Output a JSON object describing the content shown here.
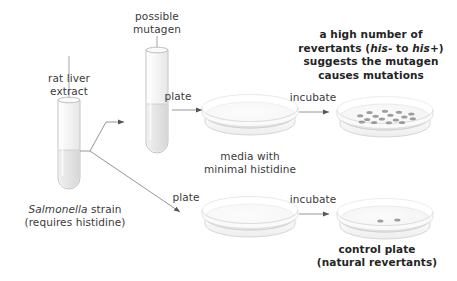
{
  "diagram": {
    "colors": {
      "text": "#3b3b3b",
      "text_bold": "#242424",
      "line": "#7a7a7a",
      "glass": "#c9c9c9",
      "glass_fill": "#f4f4f4",
      "media": "#e8e8e8",
      "colony": "#8d8d8d",
      "background": "#ffffff"
    },
    "labels": {
      "rat_liver_extract": "rat liver\nextract",
      "possible_mutagen": "possible\nmutagen",
      "salmonella_strain_line1_italic": "Salmonella",
      "salmonella_strain_line1_rest": " strain",
      "salmonella_strain_line2": "(requires histidine)",
      "plate_top": "plate",
      "plate_bottom": "plate",
      "incubate_top": "incubate",
      "incubate_bottom": "incubate",
      "media_with_minimal_histidine": "media with\nminimal histidine",
      "conclusion_line1": "a high number of",
      "conclusion_line2_a": "revertants (",
      "conclusion_line2_his_minus": "his",
      "conclusion_line2_b": "- to ",
      "conclusion_line2_his_plus": "his",
      "conclusion_line2_c": "+)",
      "conclusion_line3": "suggests the mutagen",
      "conclusion_line4": "causes mutations",
      "control_plate_line1": "control plate",
      "control_plate_line2": "(natural revertants)"
    },
    "tubes": [
      {
        "id": "rat-liver-extract-tube",
        "label_key": "rat_liver_extract",
        "contents": "rat liver extract",
        "has_down_arrow": true
      },
      {
        "id": "possible-mutagen-tube",
        "label_key": "possible_mutagen",
        "contents": "possible mutagen",
        "has_down_arrow": true
      }
    ],
    "plates": [
      {
        "id": "top-plate-before-incubation",
        "row": "top",
        "stage": "before-incubation",
        "colony_count": 0,
        "media": "minimal histidine"
      },
      {
        "id": "top-plate-after-incubation",
        "row": "top",
        "stage": "after-incubation",
        "colony_count": 16,
        "media": "minimal histidine"
      },
      {
        "id": "control-plate-before-incubation",
        "row": "bottom",
        "stage": "before-incubation",
        "colony_count": 0,
        "media": "minimal histidine"
      },
      {
        "id": "control-plate-after-incubation",
        "row": "bottom",
        "stage": "after-incubation",
        "colony_count": 2,
        "media": "minimal histidine"
      }
    ],
    "colony_positions_mutagen": [
      [
        0.3,
        0.28
      ],
      [
        0.5,
        0.22
      ],
      [
        0.68,
        0.27
      ],
      [
        0.84,
        0.36
      ],
      [
        0.18,
        0.44
      ],
      [
        0.38,
        0.46
      ],
      [
        0.57,
        0.42
      ],
      [
        0.75,
        0.5
      ],
      [
        0.27,
        0.62
      ],
      [
        0.46,
        0.6
      ],
      [
        0.64,
        0.64
      ],
      [
        0.86,
        0.58
      ],
      [
        0.36,
        0.76
      ],
      [
        0.55,
        0.78
      ],
      [
        0.72,
        0.76
      ],
      [
        0.2,
        0.74
      ]
    ],
    "colony_positions_control": [
      [
        0.44,
        0.6
      ],
      [
        0.66,
        0.55
      ]
    ]
  }
}
